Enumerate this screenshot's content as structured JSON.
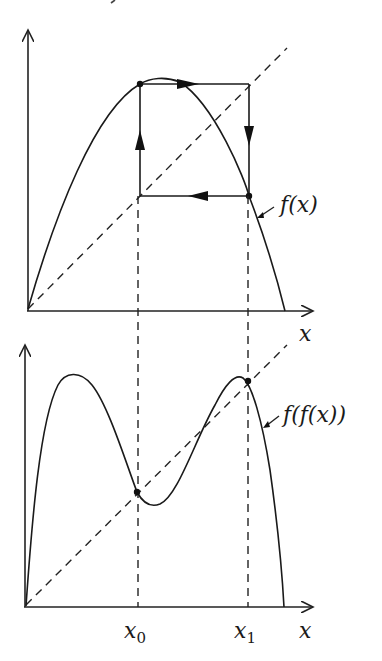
{
  "figure": {
    "top_panel": {
      "x_axis_label": "x",
      "curve_label": "f(x)",
      "curve": "single hump (logistic-like) map f(x)",
      "cobweb": "period-2 cycle square between x0 and x1 with arrows",
      "diagonal": "y = x (dashed)"
    },
    "bottom_panel": {
      "x_axis_label": "x",
      "curve_label": "f(f(x))",
      "curve": "double hump second iterate f(f(x))",
      "diagonal": "y = x (dashed)",
      "tick_labels": [
        {
          "base": "x",
          "sub": "0"
        },
        {
          "base": "x",
          "sub": "1"
        }
      ]
    },
    "top_cropped_fragment": "y"
  }
}
